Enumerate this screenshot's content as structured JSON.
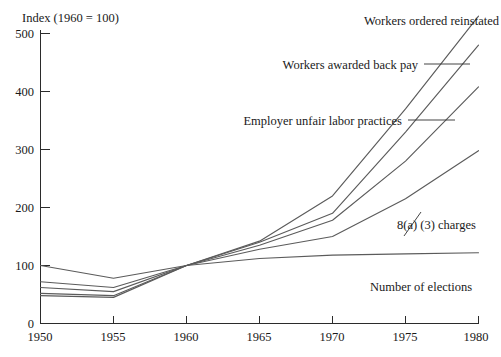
{
  "chart_data": {
    "type": "line",
    "title": "",
    "subtitle": "",
    "ylabel": "Index (1960 = 100)",
    "xlabel": "",
    "x": [
      1950,
      1955,
      1960,
      1965,
      1970,
      1975,
      1980
    ],
    "xticklabels": [
      "1950",
      "1955",
      "1960",
      "1965",
      "1970",
      "1975",
      "1980"
    ],
    "yticklabels": [
      "0",
      "100",
      "200",
      "300",
      "400",
      "500"
    ],
    "yticks": [
      0,
      100,
      200,
      300,
      400,
      500
    ],
    "xlim": [
      1950,
      1980
    ],
    "ylim": [
      0,
      560
    ],
    "grid": false,
    "legend_position": "inline-annotations",
    "line_color": "#5b5b5b",
    "axis_color": "#2b2b2b",
    "background": "#ffffff",
    "series": [
      {
        "name": "Workers ordered reinstated",
        "values": [
          48,
          45,
          100,
          142,
          220,
          370,
          530
        ],
        "label_anchor": "end"
      },
      {
        "name": "Workers awarded back pay",
        "values": [
          52,
          48,
          100,
          140,
          190,
          330,
          480
        ],
        "label_anchor": "end"
      },
      {
        "name": "Employer unfair labor practices",
        "values": [
          62,
          55,
          100,
          135,
          178,
          280,
          408
        ],
        "label_anchor": "end"
      },
      {
        "name": "8(a) (3) charges",
        "values": [
          72,
          62,
          100,
          128,
          150,
          215,
          298
        ],
        "label_anchor": "start"
      },
      {
        "name": "Number of elections",
        "values": [
          100,
          78,
          100,
          112,
          118,
          120,
          122
        ],
        "label_anchor": "start"
      }
    ]
  },
  "axis": {
    "y_title": "Index (1960 = 100)",
    "y_ticks": [
      "500",
      "400",
      "300",
      "200",
      "100",
      "0"
    ],
    "x_ticks": [
      "1950",
      "1955",
      "1960",
      "1965",
      "1970",
      "1975",
      "1980"
    ]
  },
  "annotations": {
    "label_1": "Workers ordered reinstated",
    "label_2": "Workers awarded back pay",
    "label_3": "Employer unfair labor practices",
    "label_4": "8(a) (3) charges",
    "label_5": "Number of elections"
  }
}
